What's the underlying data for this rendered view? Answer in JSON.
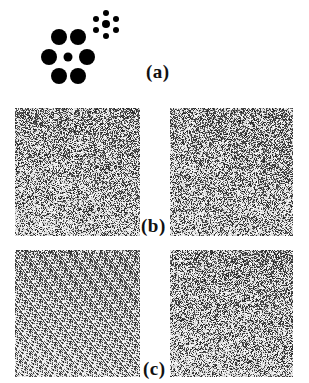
{
  "figure": {
    "panels": [
      {
        "id": "a",
        "label": "(a)",
        "description": "Sunflower illusion dot clusters",
        "clusters": [
          {
            "name": "large-cluster",
            "center": {
              "x": 68,
              "y": 57,
              "r": 4.5
            },
            "petals": [
              {
                "x": 59,
                "y": 37,
                "r": 8
              },
              {
                "x": 78,
                "y": 37,
                "r": 8
              },
              {
                "x": 49,
                "y": 57,
                "r": 8
              },
              {
                "x": 87,
                "y": 57,
                "r": 8
              },
              {
                "x": 59,
                "y": 76,
                "r": 8
              },
              {
                "x": 78,
                "y": 76,
                "r": 8
              }
            ]
          },
          {
            "name": "small-cluster",
            "center": {
              "x": 106,
              "y": 24,
              "r": 4
            },
            "petals": [
              {
                "x": 106,
                "y": 13,
                "r": 3
              },
              {
                "x": 96,
                "y": 19,
                "r": 3
              },
              {
                "x": 116,
                "y": 19,
                "r": 3
              },
              {
                "x": 96,
                "y": 30,
                "r": 3
              },
              {
                "x": 116,
                "y": 30,
                "r": 3
              },
              {
                "x": 106,
                "y": 36,
                "r": 3
              }
            ]
          }
        ],
        "dot_color": "#000000"
      },
      {
        "id": "b",
        "label": "(b)",
        "description": "Pair of random-dot noise images",
        "images": [
          {
            "name": "noise-left",
            "seed": 11
          },
          {
            "name": "noise-right",
            "seed": 23
          }
        ]
      },
      {
        "id": "c",
        "label": "(c)",
        "description": "Pair of random-dot noise images",
        "images": [
          {
            "name": "noise-left",
            "seed": 37
          },
          {
            "name": "noise-right",
            "seed": 53
          }
        ]
      }
    ]
  }
}
